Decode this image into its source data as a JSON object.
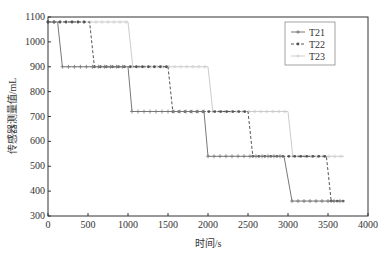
{
  "chart_data": {
    "type": "line",
    "title": "",
    "xlabel": "时间/s",
    "ylabel": "传感器测量值/mL",
    "xlim": [
      0,
      4000
    ],
    "ylim": [
      300,
      1100
    ],
    "xticks": [
      0,
      500,
      1000,
      1500,
      2000,
      2500,
      3000,
      3500,
      4000
    ],
    "yticks": [
      300,
      400,
      500,
      600,
      700,
      800,
      900,
      1000,
      1100
    ],
    "grid": false,
    "legend_position": "upper right",
    "series": [
      {
        "name": "T21",
        "color": "#777777",
        "style": "solid",
        "marker": "+",
        "x": [
          0,
          120,
          180,
          1000,
          1050,
          1950,
          2000,
          2950,
          3050,
          3700
        ],
        "y": [
          1080,
          1080,
          900,
          900,
          720,
          720,
          540,
          540,
          360,
          360
        ]
      },
      {
        "name": "T22",
        "color": "#555555",
        "style": "dashed",
        "marker": "*",
        "x": [
          0,
          520,
          580,
          1500,
          1560,
          2500,
          2560,
          3480,
          3540,
          3700
        ],
        "y": [
          1080,
          1080,
          900,
          900,
          720,
          720,
          540,
          540,
          360,
          360
        ]
      },
      {
        "name": "T23",
        "color": "#cccccc",
        "style": "solid",
        "marker": "o",
        "x": [
          0,
          1000,
          1060,
          2000,
          2060,
          3000,
          3060,
          3700
        ],
        "y": [
          1080,
          1080,
          900,
          900,
          720,
          720,
          540,
          540
        ]
      }
    ]
  }
}
